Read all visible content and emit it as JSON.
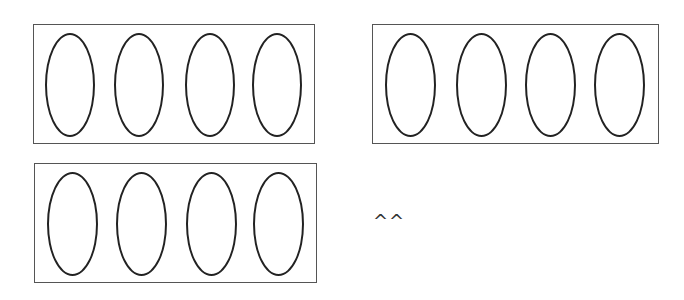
{
  "diagram": {
    "groups": [
      {
        "name": "group-1",
        "x": 33,
        "y": 24,
        "w": 282,
        "h": 120,
        "ovals": 4
      },
      {
        "name": "group-2",
        "x": 372,
        "y": 24,
        "w": 287,
        "h": 120,
        "ovals": 4
      },
      {
        "name": "group-3",
        "x": 34,
        "y": 163,
        "w": 283,
        "h": 120,
        "ovals": 4
      }
    ],
    "oval": {
      "width": 50,
      "height": 104,
      "stroke": "#222222"
    },
    "box_stroke": "#555555",
    "caret_text": "^^"
  }
}
